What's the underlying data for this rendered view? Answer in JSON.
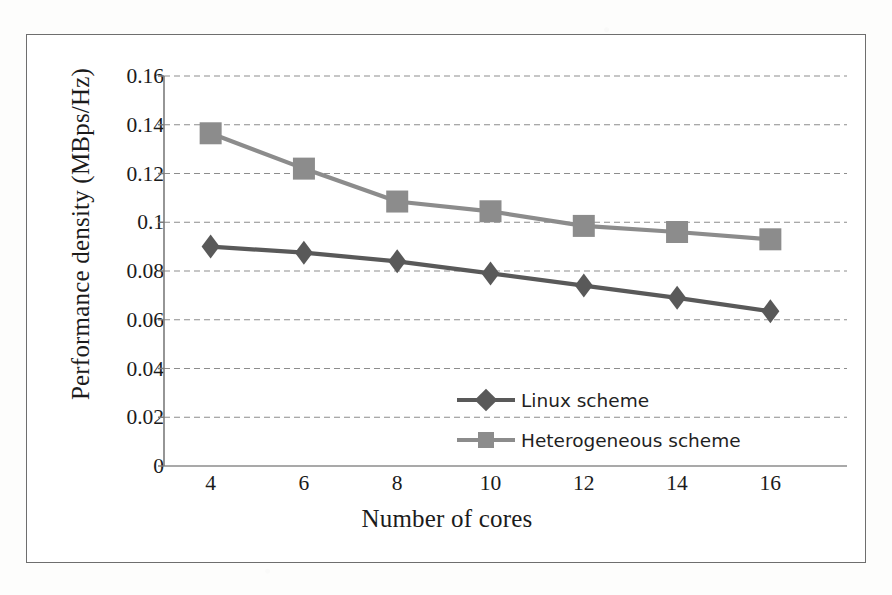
{
  "figure": {
    "frame_color": "#6e6e6e",
    "background": "#ffffff"
  },
  "axes": {
    "y_title": "Performance density (MBps/Hz)",
    "x_title": "Number of cores",
    "y_ticks": [
      "0",
      "0.02",
      "0.04",
      "0.06",
      "0.08",
      "0.1",
      "0.12",
      "0.14",
      "0.16"
    ],
    "x_ticks": [
      "4",
      "6",
      "8",
      "10",
      "12",
      "14",
      "16"
    ],
    "gridline_color": "#8d8d8d",
    "axis_line_color": "#7b7b7b"
  },
  "legend": {
    "position": "inside-lower-center",
    "entries": [
      {
        "label": "Linux scheme",
        "color": "#595959",
        "marker": "diamond-marker"
      },
      {
        "label": "Heterogeneous scheme",
        "color": "#8c8c8c",
        "marker": "square-marker"
      }
    ]
  },
  "chart_data": {
    "type": "line",
    "title": "",
    "subtitle": "",
    "xlabel": "Number of cores",
    "ylabel": "Performance density (MBps/Hz)",
    "x": [
      4,
      6,
      8,
      10,
      12,
      14,
      16
    ],
    "categories": [
      "4",
      "6",
      "8",
      "10",
      "12",
      "14",
      "16"
    ],
    "xlim": [
      3,
      17
    ],
    "ylim": [
      0,
      0.16
    ],
    "ytick_step": 0.02,
    "grid": "horizontal-dashed",
    "legend_position": "inside-lower-center",
    "series": [
      {
        "name": "Linux scheme",
        "color": "#595959",
        "marker": "diamond",
        "values": [
          0.09,
          0.0875,
          0.084,
          0.079,
          0.074,
          0.069,
          0.0635
        ]
      },
      {
        "name": "Heterogeneous scheme",
        "color": "#8c8c8c",
        "marker": "square",
        "values": [
          0.1365,
          0.122,
          0.1085,
          0.1045,
          0.0985,
          0.096,
          0.093
        ]
      }
    ]
  }
}
